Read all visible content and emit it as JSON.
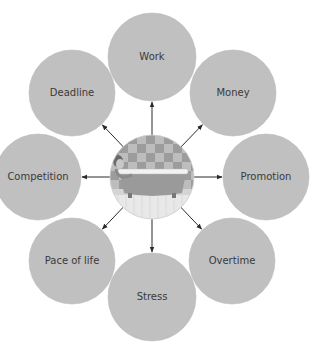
{
  "diagram": {
    "type": "radial-mind-map",
    "center": {
      "label": "Person relaxing in bathtub",
      "icon": "bathtub-illustration-icon",
      "cx": 152,
      "cy": 177,
      "r": 42
    },
    "colors": {
      "node_fill": "#c0c0c0",
      "node_stroke": "#b8b8b8",
      "text": "#3a3a3a",
      "arrow": "#2a2a2a",
      "tile_dark": "#9c9c9c",
      "tile_light": "#bdbdbd"
    },
    "nodes": [
      {
        "label": "Work",
        "cx": 152,
        "cy": 57,
        "r": 44
      },
      {
        "label": "Money",
        "cx": 233,
        "cy": 93,
        "r": 43
      },
      {
        "label": "Promotion",
        "cx": 266,
        "cy": 177,
        "r": 43
      },
      {
        "label": "Overtime",
        "cx": 232,
        "cy": 261,
        "r": 43
      },
      {
        "label": "Stress",
        "cx": 152,
        "cy": 297,
        "r": 44
      },
      {
        "label": "Pace of life",
        "cx": 72,
        "cy": 261,
        "r": 43
      },
      {
        "label": "Competition",
        "cx": 38,
        "cy": 177,
        "r": 43
      },
      {
        "label": "Deadline",
        "cx": 72,
        "cy": 93,
        "r": 43
      }
    ]
  }
}
